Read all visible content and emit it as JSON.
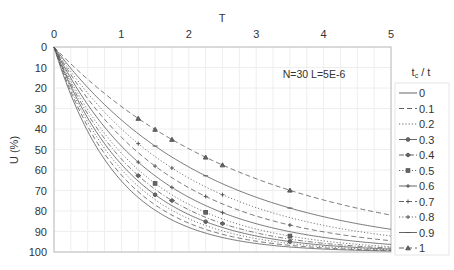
{
  "chart_data": {
    "type": "line",
    "title": "",
    "xlabel": "T",
    "ylabel": "U (%)",
    "xlim": [
      0,
      5
    ],
    "ylim": [
      100,
      0
    ],
    "y_inverted": true,
    "x_axis_position": "top",
    "x_ticks": [
      "0",
      "1",
      "2",
      "3",
      "4",
      "5"
    ],
    "y_ticks": [
      "0",
      "10",
      "20",
      "30",
      "40",
      "50",
      "60",
      "70",
      "80",
      "90",
      "100"
    ],
    "grid": true,
    "annotation": "N=30 L=5E-6",
    "legend_title": "tc / t",
    "legend_position": "right",
    "x": [
      0,
      0.25,
      0.5,
      0.75,
      1,
      1.25,
      1.5,
      1.75,
      2,
      2.25,
      2.5,
      2.75,
      3,
      3.25,
      3.5,
      3.75,
      4,
      4.25,
      4.5,
      4.75,
      5
    ],
    "series": [
      {
        "name": "0",
        "k": 1.06,
        "style": "solid",
        "marker": "none",
        "values": [
          0,
          23,
          41,
          55,
          65,
          73,
          80,
          85,
          88,
          91,
          93,
          95,
          96,
          97,
          98,
          98,
          99,
          99,
          99,
          99,
          99.5
        ]
      },
      {
        "name": "0.1",
        "k": 0.98,
        "style": "dashed",
        "marker": "none",
        "values": [
          0,
          22,
          39,
          52,
          62,
          71,
          77,
          82,
          86,
          89,
          91,
          93,
          95,
          96,
          97,
          98,
          98,
          98.5,
          99,
          99,
          99.3
        ]
      },
      {
        "name": "0.2",
        "k": 0.91,
        "style": "dotted",
        "marker": "none",
        "values": [
          0,
          20,
          37,
          49,
          60,
          68,
          75,
          80,
          84,
          87,
          90,
          92,
          93,
          95,
          96,
          97,
          97,
          98,
          98,
          99,
          99
        ]
      },
      {
        "name": "0.3",
        "k": 0.85,
        "style": "solid",
        "marker": "circle",
        "values": [
          0,
          19,
          35,
          47,
          57,
          65,
          72,
          77,
          82,
          85,
          88,
          90,
          92,
          94,
          95,
          96,
          97,
          97,
          98,
          98,
          98.6
        ]
      },
      {
        "name": "0.4",
        "k": 0.79,
        "style": "dashdot",
        "marker": "diamond",
        "values": [
          0,
          18,
          33,
          45,
          54,
          63,
          69,
          75,
          79,
          83,
          86,
          89,
          91,
          92,
          94,
          95,
          96,
          97,
          97,
          98,
          98
        ]
      },
      {
        "name": "0.5",
        "k": 0.73,
        "style": "dotted",
        "marker": "square",
        "values": [
          0,
          17,
          31,
          42,
          52,
          60,
          67,
          72,
          77,
          81,
          84,
          87,
          89,
          91,
          92,
          94,
          95,
          96,
          96,
          97,
          97.4
        ]
      },
      {
        "name": "0.6",
        "k": 0.66,
        "style": "solid",
        "marker": "plus",
        "values": [
          0,
          15,
          28,
          39,
          48,
          56,
          63,
          69,
          73,
          77,
          81,
          84,
          86,
          88,
          90,
          92,
          93,
          94,
          95,
          96,
          96.3
        ]
      },
      {
        "name": "0.7",
        "k": 0.58,
        "style": "dashed",
        "marker": "plus",
        "values": [
          0,
          14,
          25,
          35,
          44,
          52,
          58,
          64,
          69,
          73,
          77,
          80,
          82,
          85,
          87,
          89,
          90,
          91,
          93,
          94,
          94.5
        ]
      },
      {
        "name": "0.8",
        "k": 0.51,
        "style": "dotted",
        "marker": "plus",
        "values": [
          0,
          12,
          23,
          32,
          40,
          47,
          53,
          59,
          64,
          68,
          72,
          75,
          78,
          81,
          83,
          85,
          87,
          89,
          90,
          91,
          92
        ]
      },
      {
        "name": "0.9",
        "k": 0.44,
        "style": "solid",
        "marker": "dash",
        "values": [
          0,
          10,
          20,
          28,
          36,
          42,
          48,
          54,
          58,
          63,
          67,
          70,
          73,
          76,
          79,
          81,
          83,
          85,
          86,
          88,
          89
        ]
      },
      {
        "name": "1",
        "k": 0.343,
        "style": "dashed",
        "marker": "triangle",
        "values": [
          0,
          8,
          16,
          23,
          29,
          35,
          40,
          45,
          50,
          54,
          58,
          61,
          64,
          67,
          70,
          72,
          75,
          77,
          79,
          80,
          82
        ]
      }
    ]
  }
}
